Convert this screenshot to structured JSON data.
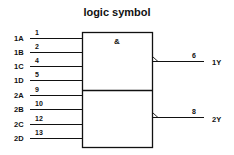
{
  "title": "logic symbol",
  "gate_symbol": "&",
  "inputs": [
    {
      "label": "1A",
      "pin": "1"
    },
    {
      "label": "1B",
      "pin": "2"
    },
    {
      "label": "1C",
      "pin": "4"
    },
    {
      "label": "1D",
      "pin": "5"
    },
    {
      "label": "2A",
      "pin": "9"
    },
    {
      "label": "2B",
      "pin": "10"
    },
    {
      "label": "2C",
      "pin": "12"
    },
    {
      "label": "2D",
      "pin": "13"
    }
  ],
  "outputs": [
    {
      "label": "1Y",
      "pin": "6"
    },
    {
      "label": "2Y",
      "pin": "8"
    }
  ],
  "colors": {
    "line": "#111111",
    "background": "#ffffff"
  }
}
